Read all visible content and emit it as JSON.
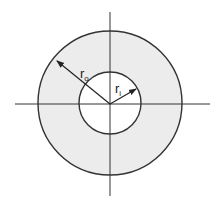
{
  "diagram": {
    "type": "annulus cross-section",
    "outer_radius_label": {
      "main": "r",
      "sub": "o"
    },
    "inner_radius_label": {
      "main": "r",
      "sub": "i"
    },
    "colors": {
      "fill": "#ececec",
      "stroke": "#333333",
      "background": "#ffffff"
    }
  }
}
